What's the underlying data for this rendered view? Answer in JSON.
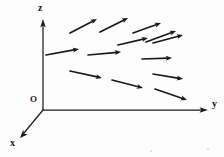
{
  "figure": {
    "kind": "vector-field-diagram",
    "background_color": "#fdfdfd",
    "ink_color": "#181818"
  },
  "axes": {
    "origin_label": "O",
    "z": {
      "label": "z",
      "from": [
        43,
        110
      ],
      "to": [
        43,
        22
      ],
      "arrowhead": true
    },
    "y": {
      "label": "y",
      "from": [
        43,
        110
      ],
      "to": [
        206,
        110
      ],
      "arrowhead": true
    },
    "x": {
      "label": "x",
      "from": [
        43,
        110
      ],
      "to": [
        21,
        137
      ],
      "arrowhead": true
    }
  },
  "chart_data": {
    "type": "vector-field",
    "title": "",
    "xlabel": "y",
    "ylabel": "z",
    "zlabel": "x",
    "arrow_count": 13,
    "arrows": [
      {
        "id": 1,
        "row": 1,
        "x1": 70,
        "y1": 33,
        "x2": 97,
        "y2": 19
      },
      {
        "id": 2,
        "row": 1,
        "x1": 100,
        "y1": 32,
        "x2": 128,
        "y2": 18
      },
      {
        "id": 3,
        "row": 1,
        "x1": 133,
        "y1": 33,
        "x2": 161,
        "y2": 23
      },
      {
        "id": 4,
        "row": 1,
        "x1": 153,
        "y1": 43,
        "x2": 183,
        "y2": 35
      },
      {
        "id": 5,
        "row": 2,
        "x1": 46,
        "y1": 55,
        "x2": 79,
        "y2": 49
      },
      {
        "id": 6,
        "row": 2,
        "x1": 88,
        "y1": 55,
        "x2": 121,
        "y2": 52
      },
      {
        "id": 7,
        "row": 2,
        "x1": 142,
        "y1": 59,
        "x2": 172,
        "y2": 58
      },
      {
        "id": 8,
        "row": 3,
        "x1": 70,
        "y1": 71,
        "x2": 102,
        "y2": 78
      },
      {
        "id": 9,
        "row": 3,
        "x1": 112,
        "y1": 80,
        "x2": 143,
        "y2": 88
      },
      {
        "id": 10,
        "row": 3,
        "x1": 153,
        "y1": 74,
        "x2": 183,
        "y2": 79
      },
      {
        "id": 11,
        "row": 4,
        "x1": 155,
        "y1": 89,
        "x2": 187,
        "y2": 100
      },
      {
        "id": 12,
        "row": 1,
        "x1": 118,
        "y1": 45,
        "x2": 148,
        "y2": 38
      },
      {
        "id": 13,
        "row": 2,
        "x1": 146,
        "y1": 42,
        "x2": 176,
        "y2": 31
      }
    ]
  }
}
